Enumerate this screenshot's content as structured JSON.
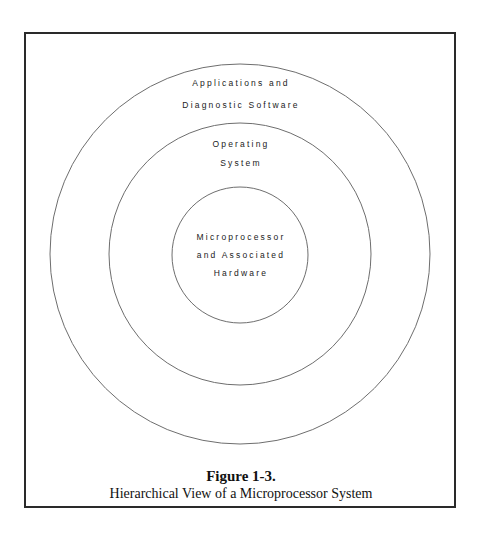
{
  "diagram": {
    "layers": [
      {
        "id": "outer",
        "lines": [
          "Applications and",
          "Diagnostic Software"
        ]
      },
      {
        "id": "middle",
        "lines": [
          "Operating",
          "System"
        ]
      },
      {
        "id": "inner",
        "lines": [
          "Microprocessor",
          "and Associated",
          "Hardware"
        ]
      }
    ],
    "stroke_color": "#6e6e6e"
  },
  "caption": {
    "title": "Figure 1-3.",
    "subtitle": "Hierarchical View of a Microprocessor System"
  }
}
